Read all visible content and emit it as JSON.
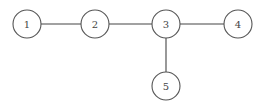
{
  "diagram": {
    "type": "graph",
    "nodes": [
      {
        "id": "1",
        "label": "1",
        "x": 27,
        "y": 24
      },
      {
        "id": "2",
        "label": "2",
        "x": 95,
        "y": 24
      },
      {
        "id": "3",
        "label": "3",
        "x": 166,
        "y": 24
      },
      {
        "id": "4",
        "label": "4",
        "x": 238,
        "y": 24
      },
      {
        "id": "5",
        "label": "5",
        "x": 166,
        "y": 86
      }
    ],
    "edges": [
      {
        "from": "1",
        "to": "2"
      },
      {
        "from": "2",
        "to": "3"
      },
      {
        "from": "3",
        "to": "4"
      },
      {
        "from": "3",
        "to": "5"
      }
    ],
    "node_radius": 14
  }
}
